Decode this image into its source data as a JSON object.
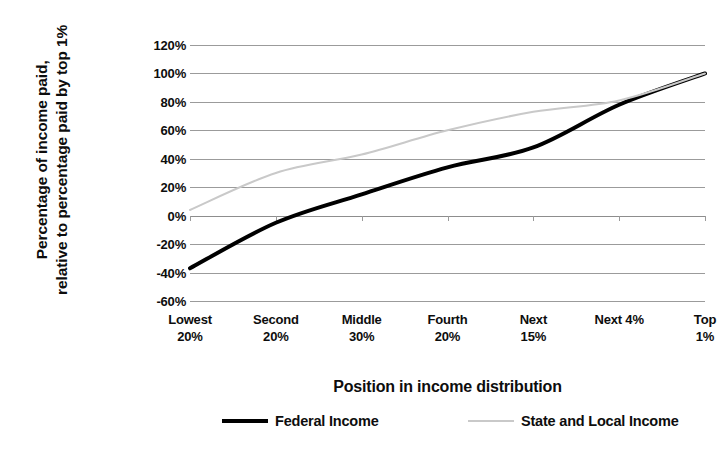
{
  "chart_data": {
    "type": "line",
    "title": "",
    "xlabel": "Position in income distribution",
    "ylabel": "Percentage of income paid,\nrelative to percentage paid by top 1%",
    "categories": [
      "Lowest\n20%",
      "Second\n20%",
      "Middle\n30%",
      "Fourth\n20%",
      "Next\n15%",
      "Next 4%",
      "Top 1%"
    ],
    "ytick_labels": [
      "120%",
      "100%",
      "80%",
      "60%",
      "40%",
      "20%",
      "0%",
      "-20%",
      "-40%",
      "-60%"
    ],
    "ytick_values": [
      120,
      100,
      80,
      60,
      40,
      20,
      0,
      -20,
      -40,
      -60
    ],
    "ylim": [
      -60,
      120
    ],
    "grid": true,
    "legend_position": "bottom",
    "series": [
      {
        "name": "Federal Income",
        "color": "#000000",
        "width": 4,
        "values": [
          -37,
          -5,
          15,
          34,
          48,
          78,
          100
        ]
      },
      {
        "name": "State and Local Income",
        "color": "#c9c9c9",
        "width": 2,
        "values": [
          4,
          30,
          43,
          60,
          73,
          81,
          100
        ]
      }
    ]
  },
  "axis": {
    "y_title": "Percentage of income paid,\nrelative to percentage paid by top 1%",
    "x_title": "Position in income distribution"
  },
  "legend": {
    "items": [
      {
        "label": "Federal Income",
        "swatch": "thick-black-line-swatch"
      },
      {
        "label": "State and Local Income",
        "swatch": "thin-gray-line-swatch"
      }
    ]
  }
}
